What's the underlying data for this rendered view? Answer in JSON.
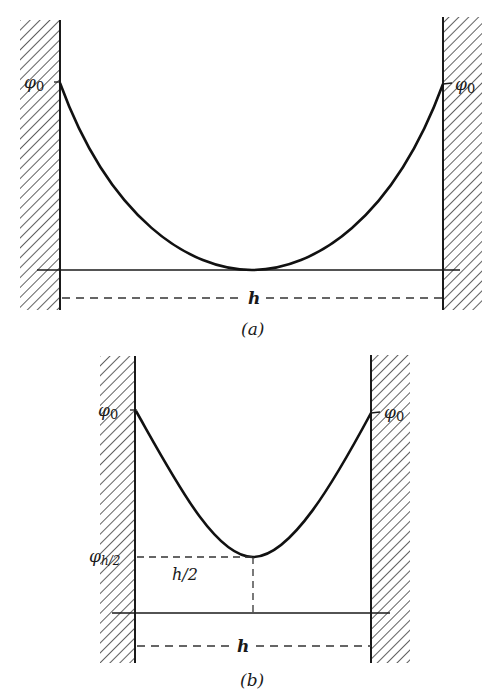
{
  "colors": {
    "ink": "#1a1a1a",
    "hatch": "#3a3a3a",
    "background": "#ffffff"
  },
  "panel_a": {
    "caption": "(a)",
    "left_label": "φ₀",
    "left_label_base": "φ",
    "left_label_sub": "0",
    "right_label_base": "φ",
    "right_label_sub": "0",
    "width_label": "h",
    "curve": "symmetric potential profile touching baseline at midpoint"
  },
  "panel_b": {
    "caption": "(b)",
    "left_label_base": "φ",
    "left_label_sub": "0",
    "right_label_base": "φ",
    "right_label_sub": "0",
    "mid_potential_base": "φ",
    "mid_potential_sub": "h/2",
    "half_width_label": "h/2",
    "width_label": "h",
    "curve": "symmetric potential profile with minimum above baseline at midpoint"
  }
}
